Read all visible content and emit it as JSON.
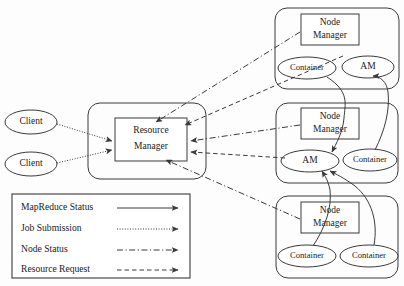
{
  "diagram": {
    "colors": {
      "stroke": "#3a3a3a",
      "text": "#1a1a1a",
      "background": "#fdfdfd",
      "shape_fill": "#ffffff"
    },
    "clients": [
      {
        "label": "Client"
      },
      {
        "label": "Client"
      }
    ],
    "resource_manager": {
      "line1": "Resource",
      "line2": "Manager"
    },
    "nodes": [
      {
        "manager_line1": "Node",
        "manager_line2": "Manager",
        "children": [
          {
            "label": "Container"
          },
          {
            "label": "AM"
          }
        ]
      },
      {
        "manager_line1": "Node",
        "manager_line2": "Manager",
        "children": [
          {
            "label": "AM"
          },
          {
            "label": "Container"
          }
        ]
      },
      {
        "manager_line1": "Node",
        "manager_line2": "Manager",
        "children": [
          {
            "label": "Container"
          },
          {
            "label": "Container"
          }
        ]
      }
    ],
    "legend": {
      "items": [
        {
          "label": "MapReduce Status",
          "style": "solid"
        },
        {
          "label": "Job Submission",
          "style": "dotted"
        },
        {
          "label": "Node Status",
          "style": "dash-dot"
        },
        {
          "label": "Resource Request",
          "style": "dashed"
        }
      ]
    }
  }
}
